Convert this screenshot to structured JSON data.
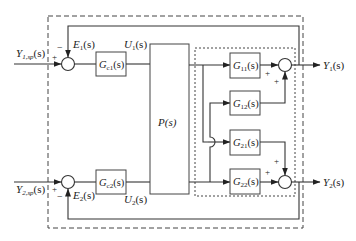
{
  "diagram": {
    "type": "block-diagram",
    "title": "",
    "inputs": {
      "y1sp": {
        "main": "Y",
        "sub": "1,sp",
        "arg": "(s)"
      },
      "y2sp": {
        "main": "Y",
        "sub": "2,sp",
        "arg": "(s)"
      }
    },
    "outputs": {
      "y1": {
        "main": "Y",
        "sub": "1",
        "arg": "(s)"
      },
      "y2": {
        "main": "Y",
        "sub": "2",
        "arg": "(s)"
      }
    },
    "errors": {
      "e1": {
        "main": "E",
        "sub": "1",
        "arg": "(s)"
      },
      "e2": {
        "main": "E",
        "sub": "2",
        "arg": "(s)"
      }
    },
    "controls": {
      "u1": {
        "main": "U",
        "sub": "1",
        "arg": "(s)"
      },
      "u2": {
        "main": "U",
        "sub": "2",
        "arg": "(s)"
      }
    },
    "blocks": {
      "gc1": {
        "main": "G",
        "sub": "c1",
        "arg": "(s)"
      },
      "gc2": {
        "main": "G",
        "sub": "c2",
        "arg": "(s)"
      },
      "p": {
        "label": "P(s)"
      },
      "g11": {
        "main": "G",
        "sub": "11",
        "arg": "(s)"
      },
      "g12": {
        "main": "G",
        "sub": "12",
        "arg": "(s)"
      },
      "g21": {
        "main": "G",
        "sub": "21",
        "arg": "(s)"
      },
      "g22": {
        "main": "G",
        "sub": "22",
        "arg": "(s)"
      }
    },
    "signs": {
      "plus": "+",
      "minus": "−"
    }
  }
}
